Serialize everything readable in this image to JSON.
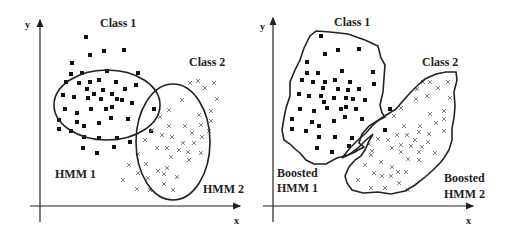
{
  "left_panel": {
    "axis_x_label": "x",
    "axis_y_label": "y",
    "class1_label": "Class 1",
    "class2_label": "Class 2",
    "model1_label": "HMM 1",
    "model2_label": "HMM 2"
  },
  "right_panel": {
    "axis_x_label": "x",
    "axis_y_label": "y",
    "class1_label": "Class 1",
    "class2_label": "Class 2",
    "model1_label_line1": "Boosted",
    "model1_label_line2": "HMM 1",
    "model2_label_line1": "Boosted",
    "model2_label_line2": "HMM 2"
  },
  "markers": {
    "class1": "filled-square",
    "class2": "cross"
  }
}
